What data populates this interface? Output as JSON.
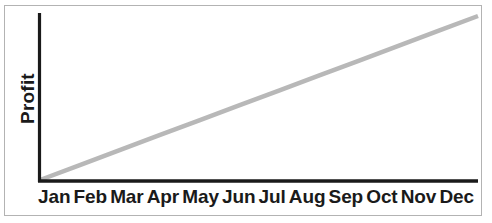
{
  "chart_data": {
    "type": "line",
    "title": "",
    "subtitle": "",
    "xlabel": "",
    "ylabel": "Profit",
    "categories": [
      "Jan",
      "Feb",
      "Mar",
      "Apr",
      "May",
      "Jun",
      "Jul",
      "Aug",
      "Sep",
      "Oct",
      "Nov",
      "Dec"
    ],
    "series": [
      {
        "name": "Profit",
        "color": "#b8b8b8",
        "values": [
          0,
          9.1,
          18.2,
          27.3,
          36.4,
          45.5,
          54.5,
          63.6,
          72.7,
          81.8,
          90.9,
          100
        ]
      }
    ],
    "ylim": [
      0,
      100
    ],
    "yticks": [],
    "yticklabels": [],
    "grid": false,
    "legend": false,
    "annotations": []
  },
  "axes": {
    "y_axis_label": "Profit",
    "y_axis_color": "#1a1a1a",
    "x_axis_color": "#1a1a1a",
    "frame_color": "#b3b3b3",
    "line_color": "#b8b8b8",
    "background": "#ffffff"
  },
  "x_labels": {
    "jan": "Jan",
    "feb": "Feb",
    "mar": "Mar",
    "apr": "Apr",
    "may": "May",
    "jun": "Jun",
    "jul": "Jul",
    "aug": "Aug",
    "sep": "Sep",
    "oct": "Oct",
    "nov": "Nov",
    "dec": "Dec"
  }
}
